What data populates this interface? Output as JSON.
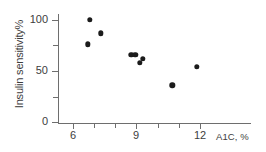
{
  "chart_data": {
    "type": "scatter",
    "title": "",
    "xlabel": "A1C, %",
    "ylabel": "Insulin sensitivity%",
    "xlim": [
      5.0,
      13.0
    ],
    "ylim": [
      0,
      112
    ],
    "grid": false,
    "legend": null,
    "x_ticks_major": [
      6,
      9,
      12
    ],
    "x_tick_labels": [
      "6",
      "9",
      "12"
    ],
    "x_ticks_minor": [
      7,
      8,
      10,
      11
    ],
    "y_ticks_major": [
      0,
      50,
      100
    ],
    "y_tick_labels": [
      "0",
      "50",
      "100"
    ],
    "y_ticks_minor": [
      25,
      75
    ],
    "marker": "filled-circle",
    "marker_color": "#1b1b1b",
    "axis_color": "#6e6e6e",
    "points": [
      {
        "x": 6.7,
        "y": 76
      },
      {
        "x": 6.8,
        "y": 100
      },
      {
        "x": 7.3,
        "y": 87
      },
      {
        "x": 8.75,
        "y": 66
      },
      {
        "x": 8.95,
        "y": 66
      },
      {
        "x": 9.15,
        "y": 58
      },
      {
        "x": 9.3,
        "y": 62
      },
      {
        "x": 10.7,
        "y": 36
      },
      {
        "x": 11.85,
        "y": 54
      }
    ]
  },
  "axes": {
    "y_title": "Insulin sensitivity%",
    "x_title": "A1C, %",
    "y_labels": [
      "100",
      "50",
      "0"
    ],
    "x_labels": [
      "6",
      "9",
      "12"
    ]
  }
}
